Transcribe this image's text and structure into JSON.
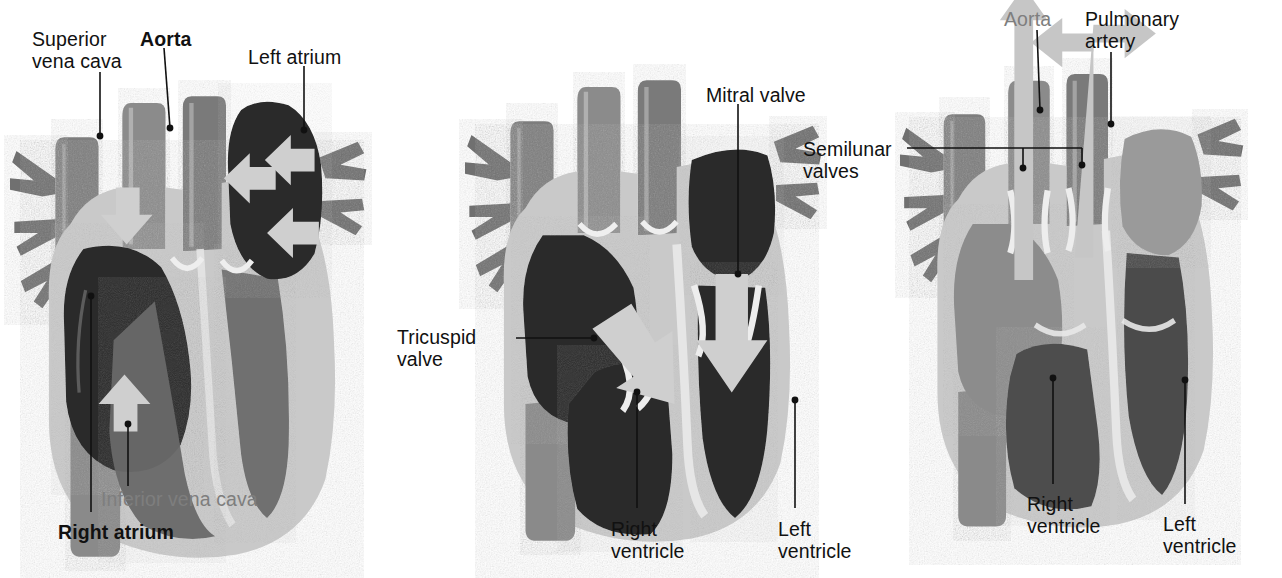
{
  "figure": {
    "background_color": "#ffffff",
    "panel_count": 3,
    "colors": {
      "background": "#ffffff",
      "chamber_blood_dark": "#2b2b2b",
      "myocardium_light": "#c9c9c9",
      "vessel_mid_gray": "#7f7f7f",
      "vessel_dark_gray": "#5a5a5a",
      "endocardium_highlight": "#e8e8e8",
      "flow_arrow": "#c4c4c4",
      "leader_line": "#111111",
      "label_black": "#111111",
      "label_gray": "#7e7e7e"
    }
  },
  "panels": [
    {
      "name": "panel-atrial-filling",
      "stage": "Atrial filling / diastole",
      "labels": [
        {
          "id": "superior-vena-cava",
          "text": "Superior\nvena cava",
          "color": "black",
          "x": 32,
          "y": 28
        },
        {
          "id": "aorta-left",
          "text": "Aorta",
          "color": "black",
          "x": 140,
          "y": 28
        },
        {
          "id": "left-atrium",
          "text": "Left atrium",
          "color": "black",
          "x": 248,
          "y": 46
        },
        {
          "id": "inferior-vena-cava",
          "text": "Inferior vena cava",
          "color": "gray",
          "x": 101,
          "y": 488
        },
        {
          "id": "right-atrium",
          "text": "Right atrium",
          "color": "black",
          "x": 58,
          "y": 521
        }
      ],
      "flow_arrows": [
        {
          "id": "svc-inflow-arrow",
          "direction": "down",
          "into": "right atrium"
        },
        {
          "id": "ivc-inflow-arrow",
          "direction": "up",
          "into": "right atrium"
        },
        {
          "id": "pulmonary-vein-arrow-1",
          "direction": "left",
          "into": "left atrium"
        },
        {
          "id": "pulmonary-vein-arrow-2",
          "direction": "left",
          "into": "left atrium"
        },
        {
          "id": "pulmonary-vein-arrow-3",
          "direction": "left",
          "into": "left atrium"
        }
      ]
    },
    {
      "name": "panel-ventricular-filling",
      "stage": "Ventricular filling — AV valves open",
      "labels": [
        {
          "id": "mitral-valve",
          "text": "Mitral valve",
          "color": "black",
          "x": 706,
          "y": 84
        },
        {
          "id": "tricuspid-valve",
          "text": "Tricuspid\nvalve",
          "color": "black",
          "x": 397,
          "y": 326
        },
        {
          "id": "right-ventricle",
          "text": "Right\nventricle",
          "color": "black",
          "x": 611,
          "y": 518
        },
        {
          "id": "left-ventricle",
          "text": "Left\nventricle",
          "color": "black",
          "x": 778,
          "y": 518
        }
      ],
      "flow_arrows": [
        {
          "id": "mitral-flow-arrow",
          "direction": "down",
          "into": "left ventricle"
        },
        {
          "id": "tricuspid-flow-arrow",
          "direction": "down-right",
          "into": "right ventricle"
        }
      ]
    },
    {
      "name": "panel-ventricular-ejection",
      "stage": "Ventricular ejection — semilunar valves open",
      "labels": [
        {
          "id": "aorta-right",
          "text": "Aorta",
          "color": "gray",
          "x": 1004,
          "y": 8
        },
        {
          "id": "pulmonary-artery",
          "text": "Pulmonary\nartery",
          "color": "black",
          "x": 1085,
          "y": 8
        },
        {
          "id": "semilunar-valves",
          "text": "Semilunar\nvalves",
          "color": "black",
          "x": 803,
          "y": 138
        },
        {
          "id": "right-ventricle-2",
          "text": "Right\nventricle",
          "color": "black",
          "x": 1027,
          "y": 493
        },
        {
          "id": "left-ventricle-2",
          "text": "Left\nventricle",
          "color": "black",
          "x": 1163,
          "y": 513
        }
      ],
      "flow_arrows": [
        {
          "id": "aortic-outflow-arrow",
          "direction": "up",
          "out_of": "left ventricle"
        },
        {
          "id": "pulmonary-outflow-arrow",
          "direction": "up-split",
          "out_of": "right ventricle"
        }
      ]
    }
  ]
}
